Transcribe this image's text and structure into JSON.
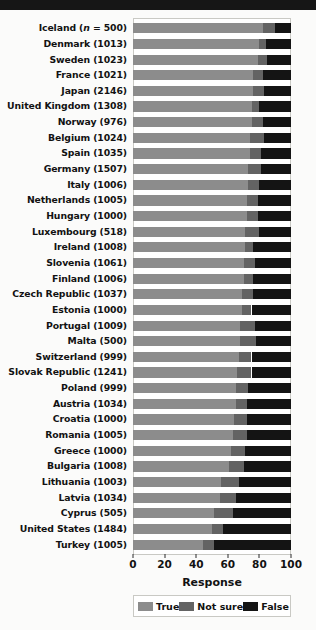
{
  "chart_data": {
    "type": "bar",
    "orientation": "horizontal",
    "stacked": true,
    "title": "",
    "xlabel": "Response",
    "ylabel": "",
    "xlim": [
      0,
      100
    ],
    "xticks": [
      0,
      20,
      40,
      60,
      80,
      100
    ],
    "grid": false,
    "legend_position": "bottom",
    "legend_title": "Response",
    "series": [
      {
        "name": "True",
        "color": "#8c8c8c"
      },
      {
        "name": "Not sure",
        "color": "#636363"
      },
      {
        "name": "False",
        "color": "#141414"
      }
    ],
    "categories": [
      "Iceland (n = 500)",
      "Denmark (1013)",
      "Sweden (1023)",
      "France (1021)",
      "Japan (2146)",
      "United Kingdom (1308)",
      "Norway (976)",
      "Belgium (1024)",
      "Spain (1035)",
      "Germany (1507)",
      "Italy (1006)",
      "Netherlands (1005)",
      "Hungary (1000)",
      "Luxembourg (518)",
      "Ireland (1008)",
      "Slovenia (1061)",
      "Finland (1006)",
      "Czech Republic (1037)",
      "Estonia (1000)",
      "Portugal (1009)",
      "Malta (500)",
      "Switzerland (999)",
      "Slovak Republic (1241)",
      "Poland (999)",
      "Austria (1034)",
      "Croatia (1000)",
      "Romania (1005)",
      "Greece (1000)",
      "Bulgaria (1008)",
      "Lithuania (1003)",
      "Latvia (1034)",
      "Cyprus (505)",
      "United States (1484)",
      "Turkey (1005)"
    ],
    "values": {
      "True": [
        82,
        80,
        79,
        76,
        76,
        75,
        75,
        74,
        74,
        73,
        73,
        72,
        72,
        71,
        71,
        70,
        70,
        69,
        69,
        68,
        68,
        67,
        66,
        65,
        65,
        64,
        63,
        62,
        61,
        56,
        55,
        51,
        50,
        44
      ],
      "Not sure": [
        8,
        4,
        6,
        6,
        7,
        5,
        7,
        9,
        7,
        8,
        7,
        7,
        7,
        9,
        5,
        7,
        6,
        7,
        6,
        9,
        10,
        8,
        9,
        8,
        7,
        8,
        9,
        9,
        9,
        11,
        10,
        12,
        7,
        7
      ],
      "False": [
        10,
        16,
        15,
        18,
        17,
        20,
        18,
        17,
        19,
        19,
        20,
        21,
        21,
        20,
        24,
        23,
        24,
        24,
        25,
        23,
        22,
        25,
        25,
        27,
        28,
        28,
        28,
        29,
        30,
        33,
        35,
        37,
        43,
        49
      ]
    }
  },
  "legend": {
    "items": [
      {
        "label": "True"
      },
      {
        "label": "Not sure"
      },
      {
        "label": "False"
      }
    ]
  },
  "axis": {
    "x_title": "Response",
    "tick_labels": [
      "0",
      "20",
      "40",
      "60",
      "80",
      "100"
    ]
  }
}
